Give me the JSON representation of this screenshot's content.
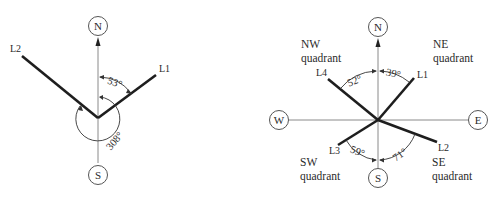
{
  "left_diagram": {
    "compass": {
      "north": "N",
      "south": "S"
    },
    "lines": [
      {
        "label": "L1"
      },
      {
        "label": "L2"
      }
    ],
    "angles": {
      "l1_from_north": "53°",
      "l2_clockwise_from_north": "308°"
    }
  },
  "right_diagram": {
    "compass": {
      "north": "N",
      "south": "S",
      "west": "W",
      "east": "E"
    },
    "quadrants": {
      "nw": {
        "line1": "NW",
        "line2": "quadrant"
      },
      "ne": {
        "line1": "NE",
        "line2": "quadrant"
      },
      "sw": {
        "line1": "SW",
        "line2": "quadrant"
      },
      "se": {
        "line1": "SE",
        "line2": "quadrant"
      }
    },
    "lines": [
      {
        "label": "L1"
      },
      {
        "label": "L2"
      },
      {
        "label": "L3"
      },
      {
        "label": "L4"
      }
    ],
    "angles": {
      "l4_from_north": "52°",
      "l1_from_north": "39°",
      "l3_from_south": "59°",
      "l2_from_south": "71°"
    }
  }
}
